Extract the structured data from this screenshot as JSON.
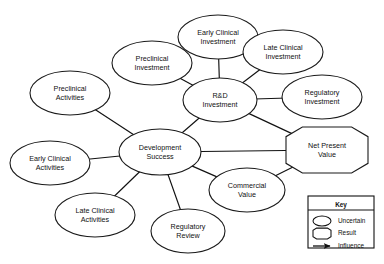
{
  "diagram": {
    "nodes": [
      {
        "id": "preclinical_activities",
        "label_line1": "Preclinical",
        "label_line2": "Activities",
        "shape": "ellipse",
        "category": "Uncertain",
        "cx": 70,
        "cy": 93,
        "rx": 40,
        "ry": 22
      },
      {
        "id": "early_clinical_activities",
        "label_line1": "Early Clinical",
        "label_line2": "Activities",
        "shape": "ellipse",
        "category": "Uncertain",
        "cx": 50,
        "cy": 163,
        "rx": 40,
        "ry": 22
      },
      {
        "id": "late_clinical_activities",
        "label_line1": "Late Clinical",
        "label_line2": "Activities",
        "shape": "ellipse",
        "category": "Uncertain",
        "cx": 95,
        "cy": 215,
        "rx": 40,
        "ry": 22
      },
      {
        "id": "regulatory_review",
        "label_line1": "Regulatory",
        "label_line2": "Review",
        "shape": "ellipse",
        "category": "Uncertain",
        "cx": 188,
        "cy": 231,
        "rx": 37,
        "ry": 22
      },
      {
        "id": "preclinical_investment",
        "label_line1": "Preclinical",
        "label_line2": "Investment",
        "shape": "ellipse",
        "category": "Uncertain",
        "cx": 152,
        "cy": 63,
        "rx": 40,
        "ry": 22
      },
      {
        "id": "early_clinical_investment",
        "label_line1": "Early Clinical",
        "label_line2": "Investment",
        "shape": "ellipse",
        "category": "Uncertain",
        "cx": 218,
        "cy": 37,
        "rx": 40,
        "ry": 22
      },
      {
        "id": "late_clinical_investment",
        "label_line1": "Late Clinical",
        "label_line2": "Investment",
        "shape": "ellipse",
        "category": "Uncertain",
        "cx": 283,
        "cy": 52,
        "rx": 40,
        "ry": 22
      },
      {
        "id": "regulatory_investment",
        "label_line1": "Regulatory",
        "label_line2": "Investment",
        "shape": "ellipse",
        "category": "Uncertain",
        "cx": 322,
        "cy": 97,
        "rx": 40,
        "ry": 22
      },
      {
        "id": "rd_investment",
        "label_line1": "R&D",
        "label_line2": "Investment",
        "shape": "ellipse",
        "category": "Uncertain",
        "cx": 220,
        "cy": 100,
        "rx": 37,
        "ry": 22
      },
      {
        "id": "development_success",
        "label_line1": "Development",
        "label_line2": "Success",
        "shape": "ellipse",
        "category": "Uncertain",
        "cx": 160,
        "cy": 152,
        "rx": 41,
        "ry": 23
      },
      {
        "id": "commercial_value",
        "label_line1": "Commercial",
        "label_line2": "Value",
        "shape": "ellipse",
        "category": "Uncertain",
        "cx": 247,
        "cy": 190,
        "rx": 38,
        "ry": 22
      },
      {
        "id": "net_present_value",
        "label_line1": "Net Present",
        "label_line2": "Value",
        "shape": "octagon",
        "category": "Result",
        "cx": 327,
        "cy": 150,
        "rx": 41,
        "ry": 23
      }
    ],
    "edges": [
      {
        "id": "e1",
        "from": "preclinical_activities",
        "to": "development_success"
      },
      {
        "id": "e2",
        "from": "early_clinical_activities",
        "to": "development_success"
      },
      {
        "id": "e3",
        "from": "late_clinical_activities",
        "to": "development_success"
      },
      {
        "id": "e4",
        "from": "regulatory_review",
        "to": "development_success"
      },
      {
        "id": "e5",
        "from": "preclinical_investment",
        "to": "rd_investment"
      },
      {
        "id": "e6",
        "from": "early_clinical_investment",
        "to": "rd_investment"
      },
      {
        "id": "e7",
        "from": "late_clinical_investment",
        "to": "rd_investment"
      },
      {
        "id": "e8",
        "from": "regulatory_investment",
        "to": "rd_investment"
      },
      {
        "id": "e9",
        "from": "development_success",
        "to": "rd_investment"
      },
      {
        "id": "e10",
        "from": "development_success",
        "to": "commercial_value"
      },
      {
        "id": "e11",
        "from": "development_success",
        "to": "net_present_value"
      },
      {
        "id": "e12",
        "from": "rd_investment",
        "to": "net_present_value"
      },
      {
        "id": "e13",
        "from": "commercial_value",
        "to": "net_present_value"
      }
    ]
  },
  "legend": {
    "title": "Key",
    "items": [
      {
        "id": "legend-uncertain",
        "symbol": "ellipse-icon",
        "label": "Uncertain"
      },
      {
        "id": "legend-result",
        "symbol": "octagon-icon",
        "label": "Result"
      },
      {
        "id": "legend-influence",
        "symbol": "arrow-icon",
        "label": "Influence"
      }
    ],
    "box": {
      "x": 308,
      "y": 196,
      "w": 66,
      "h": 52
    }
  },
  "colors": {
    "background": "#ffffff",
    "stroke": "#111111",
    "text": "#111111"
  }
}
